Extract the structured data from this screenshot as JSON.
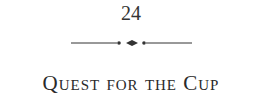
{
  "page": {
    "chapter_number": "24",
    "ornament_icon": "line-dot-diamond-dot-line-divider",
    "chapter_title": "Quest for the Cup"
  },
  "colors": {
    "text": "#2a2a2a",
    "background": "#ffffff"
  }
}
